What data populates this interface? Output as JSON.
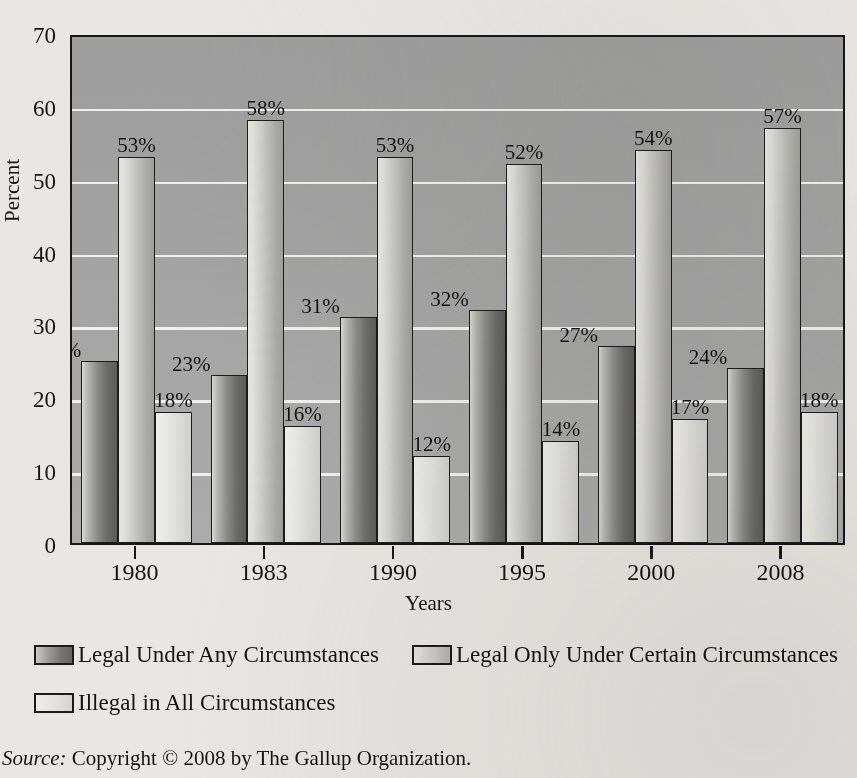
{
  "chart_data": {
    "type": "bar",
    "title": "",
    "xlabel": "Years",
    "ylabel": "Percent",
    "ylim": [
      0,
      70
    ],
    "ytick_labels": [
      "70",
      "60",
      "50",
      "40",
      "30",
      "20",
      "10",
      "0"
    ],
    "yticks": [
      70,
      60,
      50,
      40,
      30,
      20,
      10,
      0
    ],
    "grid": "horizontal-white-gridlines",
    "legend_position": "below-plot",
    "categories": [
      "1980",
      "1983",
      "1990",
      "1995",
      "2000",
      "2008"
    ],
    "series": [
      {
        "name": "Legal Under Any Circumstances",
        "values": [
          25,
          23,
          31,
          32,
          27,
          24
        ],
        "labels": [
          "25%",
          "23%",
          "31%",
          "32%",
          "27%",
          "24%"
        ],
        "color": "#6b6b68"
      },
      {
        "name": "Legal Only Under Certain Circumstances",
        "values": [
          53,
          58,
          53,
          52,
          54,
          57
        ],
        "labels": [
          "53%",
          "58%",
          "53%",
          "52%",
          "54%",
          "57%"
        ],
        "color": "#c2c2be"
      },
      {
        "name": "Illegal in All Circumstances",
        "values": [
          18,
          16,
          12,
          14,
          17,
          18
        ],
        "labels": [
          "18%",
          "16%",
          "12%",
          "14%",
          "17%",
          "18%"
        ],
        "color": "#e2e2de"
      }
    ],
    "plot_background": "#a3a3a3",
    "gridline_color": "#f3f3f0"
  },
  "source": {
    "prefix": "Source:",
    "text": "Copyright © 2008 by The Gallup Organization."
  }
}
